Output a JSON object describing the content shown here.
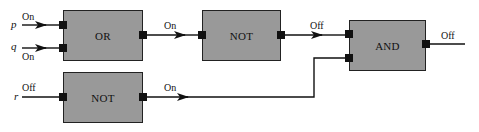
{
  "diagram": {
    "colors": {
      "gate_fill": "#999999",
      "gate_border": "#222222",
      "wire": "#111111",
      "background": "#ffffff"
    },
    "inputs": [
      {
        "id": "p",
        "name": "p",
        "state": "On"
      },
      {
        "id": "q",
        "name": "q",
        "state": "On"
      },
      {
        "id": "r",
        "name": "r",
        "state": "Off"
      }
    ],
    "gates": [
      {
        "id": "or1",
        "type": "OR",
        "label": "OR",
        "output_state": "On"
      },
      {
        "id": "not1",
        "type": "NOT",
        "label": "NOT",
        "output_state": "Off"
      },
      {
        "id": "not2",
        "type": "NOT",
        "label": "NOT",
        "output_state": "On"
      },
      {
        "id": "and1",
        "type": "AND",
        "label": "AND",
        "output_state": "Off"
      }
    ],
    "connections": [
      {
        "from": "p",
        "to": "or1",
        "state": "On"
      },
      {
        "from": "q",
        "to": "or1",
        "state": "On"
      },
      {
        "from": "or1",
        "to": "not1",
        "state": "On"
      },
      {
        "from": "not1",
        "to": "and1",
        "state": "Off"
      },
      {
        "from": "r",
        "to": "not2",
        "state": "Off"
      },
      {
        "from": "not2",
        "to": "and1",
        "state": "On"
      }
    ],
    "output": {
      "state": "Off"
    }
  }
}
